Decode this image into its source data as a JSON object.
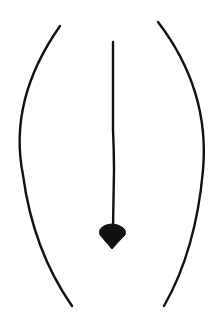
{
  "diagram": {
    "colors": {
      "background": "#ffffff",
      "stroke": "#111111",
      "arrowhead": "#111111"
    },
    "elements": [
      {
        "id": "left-arc",
        "type": "curve"
      },
      {
        "id": "right-arc",
        "type": "curve"
      },
      {
        "id": "center-arrow",
        "type": "arrow",
        "direction": "down"
      }
    ]
  }
}
